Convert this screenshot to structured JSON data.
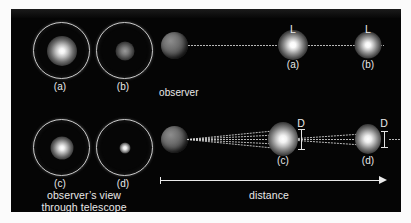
{
  "figure": {
    "background_color": "#fbfbfb",
    "panel_color": "#050505",
    "text_color": "#e9e9e9"
  },
  "labels": {
    "observer": "observer",
    "telescope_caption_line1": "observer’s view",
    "telescope_caption_line2": "through telescope",
    "distance": "distance",
    "luminosity_symbol": "L",
    "diameter_symbol": "D"
  },
  "telescope_views": [
    {
      "id": "a",
      "caption": "(a)",
      "brightness": "bright",
      "blob_size_px": 26,
      "core_color": "#ffffff"
    },
    {
      "id": "b",
      "caption": "(b)",
      "brightness": "dim",
      "blob_size_px": 16,
      "core_color": "#8a8a8a"
    },
    {
      "id": "c",
      "caption": "(c)",
      "brightness": "bright",
      "blob_size_px": 20,
      "core_color": "#ffffff"
    },
    {
      "id": "d",
      "caption": "(d)",
      "brightness": "bright-small",
      "blob_size_px": 9,
      "core_color": "#ffffff"
    }
  ],
  "top_row": {
    "description": "Same-size star at two distances; apparent luminosity L drops with distance",
    "stars": [
      {
        "caption": "(a)",
        "symbol": "L",
        "size_px": 17
      },
      {
        "caption": "(b)",
        "symbol": "L",
        "size_px": 15
      }
    ]
  },
  "bottom_row": {
    "description": "Star of diameter D at two distances; angular size shrinks with distance",
    "stars": [
      {
        "caption": "(c)",
        "symbol": "D",
        "size_px": 17
      },
      {
        "caption": "(d)",
        "symbol": "D",
        "size_px": 15
      }
    ]
  }
}
